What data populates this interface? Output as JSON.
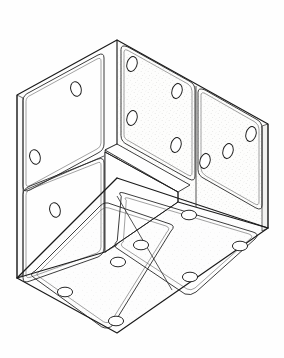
{
  "document": {
    "title": "Isometric corner assembly line drawing",
    "kind": "technical-illustration",
    "background_color": "#fefefe",
    "canvas": {
      "width": 284,
      "height": 358
    }
  },
  "style": {
    "line_color": "#1a1a1a",
    "line_color_soft": "#3a3a3a",
    "line_width_outer": 1.1,
    "line_width_inner": 0.85,
    "line_width_hole": 0.95,
    "panel_fill_light": "#fdfdfd",
    "panel_fill_shaded": "#f7f7f5",
    "panel_fill_floor": "#fbfbfa",
    "speckle_color": "#9a9a96",
    "speckle_opacity": 0.55
  },
  "structure": {
    "description": "Three mutually perpendicular walls of a cubic corner, each made of perforated rectangular panels with rounded corners and oval bolt holes.",
    "faces": [
      {
        "id": "left-wall",
        "label": "Left wall",
        "shading": "unshaded",
        "panels": [
          {
            "id": "left-upper",
            "label": "Left upper panel",
            "hole_count": 2
          },
          {
            "id": "left-lower",
            "label": "Left lower panel",
            "hole_count": 1
          }
        ]
      },
      {
        "id": "back-wall",
        "label": "Back wall",
        "shading": "stippled",
        "panels": [
          {
            "id": "back-left",
            "label": "Back left panel",
            "hole_count": 4
          },
          {
            "id": "back-right",
            "label": "Back right panel",
            "hole_count": 3
          }
        ]
      },
      {
        "id": "floor",
        "label": "Floor",
        "shading": "stippled-light",
        "panels": [
          {
            "id": "floor-left",
            "label": "Floor left panel",
            "hole_count": 3
          },
          {
            "id": "floor-right",
            "label": "Floor right panel",
            "hole_count": 4
          }
        ]
      }
    ],
    "totals": {
      "faces": 3,
      "panels": 6,
      "holes": 17
    }
  },
  "geometry": {
    "outline": "17,95 117,40 268,124 268,228 117,333 17,278",
    "corner_point": "117,178",
    "apex_top": "117,40",
    "apex_bottom": "117,333",
    "left_top": "17,95",
    "left_bottom": "17,278",
    "right_top": "268,124",
    "right_bottom": "268,228"
  },
  "holes": {
    "left_wall": [
      {
        "cx": 76,
        "cy": 89,
        "rx": 5.2,
        "ry": 7.4,
        "rot": -16
      },
      {
        "cx": 35,
        "cy": 157,
        "rx": 5.2,
        "ry": 7.4,
        "rot": -16
      },
      {
        "cx": 55,
        "cy": 210,
        "rx": 5.2,
        "ry": 7.4,
        "rot": -16
      }
    ],
    "back_wall": [
      {
        "cx": 132,
        "cy": 64,
        "rx": 5.0,
        "ry": 7.6,
        "rot": 16
      },
      {
        "cx": 177,
        "cy": 91,
        "rx": 5.0,
        "ry": 7.6,
        "rot": 16
      },
      {
        "cx": 132,
        "cy": 118,
        "rx": 5.0,
        "ry": 7.6,
        "rot": 16
      },
      {
        "cx": 176,
        "cy": 145,
        "rx": 5.0,
        "ry": 7.6,
        "rot": 16
      },
      {
        "cx": 205,
        "cy": 161,
        "rx": 5.0,
        "ry": 7.6,
        "rot": 16
      },
      {
        "cx": 228,
        "cy": 151,
        "rx": 5.0,
        "ry": 7.6,
        "rot": 16
      },
      {
        "cx": 251,
        "cy": 134,
        "rx": 5.0,
        "ry": 7.6,
        "rot": 16
      }
    ],
    "floor": [
      {
        "cx": 118,
        "cy": 262,
        "rx": 7.6,
        "ry": 4.8,
        "rot": 0
      },
      {
        "cx": 65,
        "cy": 292,
        "rx": 7.6,
        "ry": 4.8,
        "rot": 0
      },
      {
        "cx": 116,
        "cy": 321,
        "rx": 7.6,
        "ry": 4.8,
        "rot": 0
      },
      {
        "cx": 189,
        "cy": 215,
        "rx": 7.6,
        "ry": 4.8,
        "rot": 0
      },
      {
        "cx": 141,
        "cy": 245,
        "rx": 7.6,
        "ry": 4.8,
        "rot": 0
      },
      {
        "cx": 240,
        "cy": 246,
        "rx": 7.6,
        "ry": 4.8,
        "rot": 0
      },
      {
        "cx": 190,
        "cy": 277,
        "rx": 7.6,
        "ry": 4.8,
        "rot": 0
      }
    ]
  },
  "annotations": {
    "visible_text": [],
    "note": "No textual labels, dimensions, callouts or numbers are printed anywhere in this drawing."
  }
}
